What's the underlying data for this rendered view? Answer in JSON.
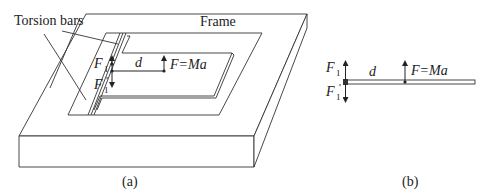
{
  "figure_a": {
    "caption": "(a)",
    "labels": {
      "torsion_bars": "Torsion bars",
      "frame": "Frame",
      "F1": "F",
      "F1_sub": "1",
      "F1p": "F",
      "F1p_sub": "1",
      "F1p_prime": "'",
      "d": "d",
      "F_eq": "F=Ma"
    }
  },
  "figure_b": {
    "caption": "(b)",
    "labels": {
      "F1": "F",
      "F1_sub": "1",
      "F1p": "F",
      "F1p_sub": "1",
      "F1p_prime": "'",
      "d": "d",
      "F_eq": "F=Ma"
    }
  },
  "colors": {
    "line": "#333333",
    "background": "#ffffff"
  }
}
